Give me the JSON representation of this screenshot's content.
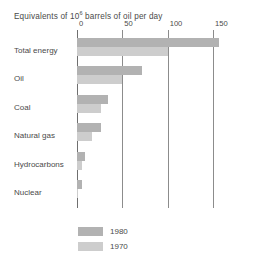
{
  "chart_data": {
    "type": "bar",
    "orientation": "horizontal",
    "title_base": "Equivalents of 10",
    "title_exponent": "6",
    "title_rest": " barrels of oil per day",
    "xlabel": "",
    "ylabel": "",
    "xlim": [
      0,
      150
    ],
    "ticks": [
      0,
      50,
      100,
      150
    ],
    "tick_labels": [
      "0",
      "50",
      "100",
      "150"
    ],
    "grid": "vertical",
    "legend_position": "bottom-left",
    "categories": [
      "Total energy",
      "Oil",
      "Coal",
      "Natural gas",
      "Hydrocarbons",
      "Nuclear"
    ],
    "series": [
      {
        "name": "1980",
        "color": "#b2b2b2",
        "values": [
          157,
          72,
          34,
          26,
          9,
          5
        ]
      },
      {
        "name": "1970",
        "color": "#cdcdcd",
        "values": [
          100,
          50,
          27,
          17,
          5,
          1
        ]
      }
    ],
    "legend": [
      {
        "label": "1980",
        "color": "#b2b2b2"
      },
      {
        "label": "1970",
        "color": "#cdcdcd"
      }
    ]
  }
}
